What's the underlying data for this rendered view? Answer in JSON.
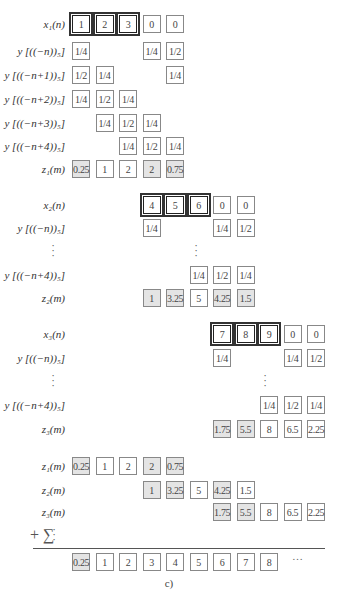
{
  "caption": "c)",
  "plus_sigma": "+ ∑",
  "ellipsis": "…",
  "blocks": [
    {
      "rows": [
        {
          "label": "x₁(n)",
          "top": 15,
          "cells": [
            {
              "c": 0,
              "v": "1",
              "hl": true
            },
            {
              "c": 1,
              "v": "2",
              "hl": true
            },
            {
              "c": 2,
              "v": "3",
              "hl": true
            },
            {
              "c": 3,
              "v": "0"
            },
            {
              "c": 4,
              "v": "0"
            }
          ]
        },
        {
          "label": "y [((−n))₅]",
          "top": 42,
          "cells": [
            {
              "c": 0,
              "v": "1/4"
            },
            {
              "c": 3,
              "v": "1/4"
            },
            {
              "c": 4,
              "v": "1/2"
            }
          ]
        },
        {
          "label": "y [((−n+1))₅]",
          "top": 66,
          "cells": [
            {
              "c": 0,
              "v": "1/2"
            },
            {
              "c": 1,
              "v": "1/4"
            },
            {
              "c": 4,
              "v": "1/4"
            }
          ]
        },
        {
          "label": "y [((−n+2))₅]",
          "top": 90,
          "cells": [
            {
              "c": 0,
              "v": "1/4"
            },
            {
              "c": 1,
              "v": "1/2"
            },
            {
              "c": 2,
              "v": "1/4"
            }
          ]
        },
        {
          "label": "y [((−n+3))₅]",
          "top": 114,
          "cells": [
            {
              "c": 1,
              "v": "1/4"
            },
            {
              "c": 2,
              "v": "1/2"
            },
            {
              "c": 3,
              "v": "1/4"
            }
          ]
        },
        {
          "label": "y [((−n+4))₅]",
          "top": 137,
          "cells": [
            {
              "c": 2,
              "v": "1/4"
            },
            {
              "c": 3,
              "v": "1/2"
            },
            {
              "c": 4,
              "v": "1/4"
            }
          ]
        },
        {
          "label": "z₁(m)",
          "top": 160,
          "cells": [
            {
              "c": 0,
              "v": "0.25",
              "sh": true
            },
            {
              "c": 1,
              "v": "1"
            },
            {
              "c": 2,
              "v": "2"
            },
            {
              "c": 3,
              "v": "2",
              "sh": true
            },
            {
              "c": 4,
              "v": "0.75",
              "sh": true
            }
          ]
        }
      ]
    },
    {
      "rows": [
        {
          "label": "x₂(n)",
          "top": 196,
          "cells": [
            {
              "c": 3,
              "v": "4",
              "hl": true
            },
            {
              "c": 4,
              "v": "5",
              "hl": true
            },
            {
              "c": 5,
              "v": "6",
              "hl": true
            },
            {
              "c": 6,
              "v": "0"
            },
            {
              "c": 7,
              "v": "0"
            }
          ]
        },
        {
          "label": "y [((−n))₅]",
          "top": 219,
          "cells": [
            {
              "c": 3,
              "v": "1/4"
            },
            {
              "c": 6,
              "v": "1/4"
            },
            {
              "c": 7,
              "v": "1/2"
            }
          ]
        },
        {
          "label": "y [((−n+4))₅]",
          "top": 266,
          "cells": [
            {
              "c": 5,
              "v": "1/4"
            },
            {
              "c": 6,
              "v": "1/2"
            },
            {
              "c": 7,
              "v": "1/4"
            }
          ]
        },
        {
          "label": "z₂(m)",
          "top": 289,
          "cells": [
            {
              "c": 3,
              "v": "1",
              "sh": true
            },
            {
              "c": 4,
              "v": "3.25",
              "sh": true
            },
            {
              "c": 5,
              "v": "5"
            },
            {
              "c": 6,
              "v": "4.25",
              "sh": true
            },
            {
              "c": 7,
              "v": "1.5",
              "sh": true
            }
          ]
        }
      ]
    },
    {
      "rows": [
        {
          "label": "x₃(n)",
          "top": 325,
          "cells": [
            {
              "c": 6,
              "v": "7",
              "hl": true
            },
            {
              "c": 7,
              "v": "8",
              "hl": true
            },
            {
              "c": 8,
              "v": "9",
              "hl": true
            },
            {
              "c": 9,
              "v": "0"
            },
            {
              "c": 10,
              "v": "0"
            }
          ]
        },
        {
          "label": "y [((−n))₅]",
          "top": 349,
          "cells": [
            {
              "c": 6,
              "v": "1/4"
            },
            {
              "c": 9,
              "v": "1/4"
            },
            {
              "c": 10,
              "v": "1/2"
            }
          ]
        },
        {
          "label": "y [((−n+4))₅]",
          "top": 396,
          "cells": [
            {
              "c": 8,
              "v": "1/4"
            },
            {
              "c": 9,
              "v": "1/2"
            },
            {
              "c": 10,
              "v": "1/4"
            }
          ]
        },
        {
          "label": "z₃(m)",
          "top": 420,
          "cells": [
            {
              "c": 6,
              "v": "1.75",
              "sh": true
            },
            {
              "c": 7,
              "v": "5.5",
              "sh": true
            },
            {
              "c": 8,
              "v": "8"
            },
            {
              "c": 9,
              "v": "6.5"
            },
            {
              "c": 10,
              "v": "2.25"
            }
          ]
        }
      ]
    },
    {
      "rows": [
        {
          "label": "z₁(m)",
          "top": 457,
          "cells": [
            {
              "c": 0,
              "v": "0.25",
              "sh": true
            },
            {
              "c": 1,
              "v": "1"
            },
            {
              "c": 2,
              "v": "2"
            },
            {
              "c": 3,
              "v": "2",
              "sh": true
            },
            {
              "c": 4,
              "v": "0.75",
              "sh": true
            }
          ]
        },
        {
          "label": "z₂(m)",
          "top": 481,
          "cells": [
            {
              "c": 3,
              "v": "1",
              "sh": true
            },
            {
              "c": 4,
              "v": "3.25",
              "sh": true
            },
            {
              "c": 5,
              "v": "5"
            },
            {
              "c": 6,
              "v": "4.25",
              "sh": true
            },
            {
              "c": 7,
              "v": "1.5"
            }
          ]
        },
        {
          "label": "z₃(m)",
          "top": 503,
          "cells": [
            {
              "c": 6,
              "v": "1.75",
              "sh": true
            },
            {
              "c": 7,
              "v": "5.5",
              "sh": true
            },
            {
              "c": 8,
              "v": "8"
            },
            {
              "c": 9,
              "v": "6.5"
            },
            {
              "c": 10,
              "v": "2.25"
            }
          ]
        }
      ]
    },
    {
      "rows": [
        {
          "label": "",
          "top": 553,
          "cells": [
            {
              "c": 0,
              "v": "0.25",
              "sh": true
            },
            {
              "c": 1,
              "v": "1"
            },
            {
              "c": 2,
              "v": "2"
            },
            {
              "c": 3,
              "v": "3"
            },
            {
              "c": 4,
              "v": "4"
            },
            {
              "c": 5,
              "v": "5"
            },
            {
              "c": 6,
              "v": "6"
            },
            {
              "c": 7,
              "v": "7"
            },
            {
              "c": 8,
              "v": "8"
            }
          ]
        }
      ]
    }
  ],
  "vdots": [
    {
      "left": 50,
      "top": 243
    },
    {
      "left": 193,
      "top": 243
    },
    {
      "left": 50,
      "top": 373
    },
    {
      "left": 262,
      "top": 373
    },
    {
      "left": 51,
      "top": 527
    }
  ]
}
